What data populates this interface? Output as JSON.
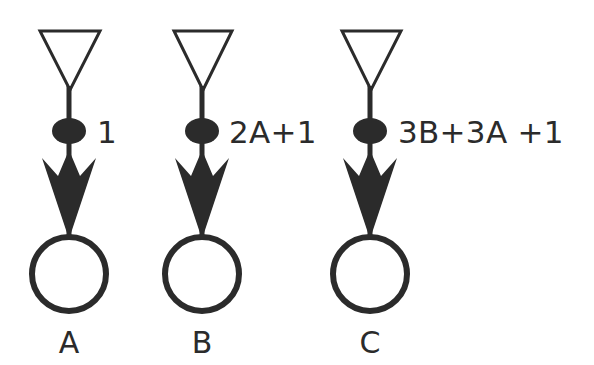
{
  "diagram": {
    "background_color": "#ffffff",
    "ink_color": "#2b2b2b",
    "units": [
      {
        "id": "unit-a",
        "node_label": "A",
        "weight_label": "1",
        "source_icon": "inverted-triangle-icon",
        "gate_icon": "filled-ellipse-icon",
        "arrow_icon": "barbed-down-arrow-icon",
        "node_icon": "open-circle-icon",
        "column_center_x": 69,
        "weight_label_x": 97,
        "weight_label_y": 143
      },
      {
        "id": "unit-b",
        "node_label": "B",
        "weight_label": "2A+1",
        "source_icon": "inverted-triangle-icon",
        "gate_icon": "filled-ellipse-icon",
        "arrow_icon": "barbed-down-arrow-icon",
        "node_icon": "open-circle-icon",
        "column_center_x": 202,
        "weight_label_x": 229,
        "weight_label_y": 143
      },
      {
        "id": "unit-c",
        "node_label": "C",
        "weight_label": "3B+3A +1",
        "source_icon": "inverted-triangle-icon",
        "gate_icon": "filled-ellipse-icon",
        "arrow_icon": "barbed-down-arrow-icon",
        "node_icon": "open-circle-icon",
        "column_center_x": 370,
        "weight_label_x": 398,
        "weight_label_y": 143
      }
    ]
  }
}
